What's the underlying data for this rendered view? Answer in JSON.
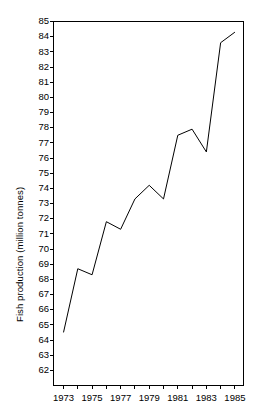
{
  "chart_data": {
    "type": "line",
    "title": "",
    "xlabel": "",
    "ylabel": "Fish production (million tonnes)",
    "x": [
      1973,
      1974,
      1975,
      1976,
      1977,
      1978,
      1979,
      1980,
      1981,
      1982,
      1983,
      1984,
      1985
    ],
    "values": [
      64.5,
      68.7,
      68.3,
      71.8,
      71.3,
      73.3,
      74.2,
      73.3,
      77.5,
      77.9,
      76.4,
      83.6,
      84.3
    ],
    "series": [
      {
        "name": "Fish production",
        "values": [
          64.5,
          68.7,
          68.3,
          71.8,
          71.3,
          73.3,
          74.2,
          73.3,
          77.5,
          77.9,
          76.4,
          83.6,
          84.3
        ]
      }
    ],
    "xlim": [
      1972.3,
      1985.6
    ],
    "ylim": [
      61.0,
      85.0
    ],
    "xticks": [
      1973,
      1974,
      1975,
      1976,
      1977,
      1978,
      1979,
      1980,
      1981,
      1982,
      1983,
      1984,
      1985
    ],
    "xtick_labels": [
      "1973",
      "",
      "1975",
      "",
      "1977",
      "",
      "1979",
      "",
      "1981",
      "",
      "1983",
      "",
      "1985"
    ],
    "yticks": [
      62,
      63,
      64,
      65,
      66,
      67,
      68,
      69,
      70,
      71,
      72,
      73,
      74,
      75,
      76,
      77,
      78,
      79,
      80,
      81,
      82,
      83,
      84,
      85
    ],
    "ytick_labels": [
      "62",
      "63",
      "64",
      "65",
      "66",
      "67",
      "68",
      "69",
      "70",
      "71",
      "72",
      "73",
      "74",
      "75",
      "76",
      "77",
      "78",
      "79",
      "80",
      "81",
      "82",
      "83",
      "84",
      "85"
    ],
    "grid": false,
    "legend": false,
    "line_color": "#000000",
    "axis_color": "#000000",
    "background_color": "#ffffff"
  }
}
